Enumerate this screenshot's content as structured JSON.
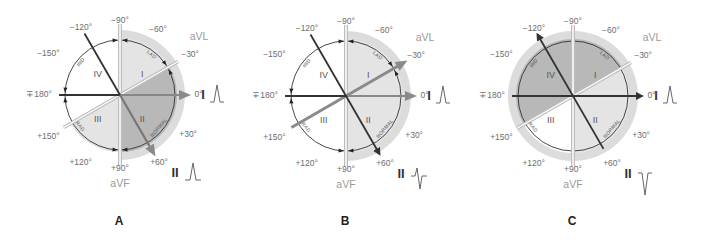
{
  "figure": {
    "panels": [
      {
        "id": "A",
        "letter": "A",
        "center": [
          120,
          95
        ],
        "radius": 57,
        "halo_sector": {
          "from": -90,
          "to": 90
        },
        "quadrant_fills": {
          "I": "#e4e4e4",
          "II": "#b8b8b8",
          "III": "#e4e4e4",
          "IV": "#ffffff"
        },
        "dark_wedge": {
          "from": -30,
          "to": 90,
          "color": "#b8b8b8"
        },
        "axis_arrow_angle": 0,
        "lead_I_wave": "upright",
        "lead_II_wave": "upright",
        "arrow_heads": {
          "lead_I": true,
          "lead_II": true,
          "minus120": false
        }
      },
      {
        "id": "B",
        "letter": "B",
        "center": [
          346,
          96
        ],
        "radius": 57,
        "halo_sector": {
          "from": -90,
          "to": 90
        },
        "quadrant_fills": {
          "I": "#e4e4e4",
          "II": "#e4e4e4",
          "III": "#ffffff",
          "IV": "#ffffff"
        },
        "dark_wedge": null,
        "axis_arrow_angle": -30,
        "lead_I_wave": "upright",
        "lead_II_wave": "biphasic",
        "arrow_heads": {
          "lead_I": true,
          "lead_II": true,
          "minus120": false
        }
      },
      {
        "id": "C",
        "letter": "C",
        "center": [
          573,
          96
        ],
        "radius": 57,
        "halo_sector": {
          "from": -180,
          "to": 180
        },
        "quadrant_fills": {
          "I": "#b8b8b8",
          "II": "#e4e4e4",
          "III": "#e4e4e4",
          "IV": "#b8b8b8"
        },
        "dark_wedge": null,
        "axis_arrow_angle": -30,
        "lead_I_wave": "upright",
        "lead_II_wave": "inverted",
        "arrow_heads": {
          "lead_I": true,
          "lead_II": false,
          "minus120": true
        }
      }
    ],
    "angle_labels": [
      {
        "text": "−90°",
        "angle": -90,
        "dist": 1.3
      },
      {
        "text": "−60°",
        "angle": -60,
        "dist": 1.33
      },
      {
        "text": "−30°",
        "angle": -30,
        "dist": 1.42
      },
      {
        "text": "0°",
        "angle": 0,
        "dist": 1.38
      },
      {
        "text": "+30°",
        "angle": 30,
        "dist": 1.38
      },
      {
        "text": "+60°",
        "angle": 60,
        "dist": 1.37
      },
      {
        "text": "+90°",
        "angle": 90,
        "dist": 1.3
      },
      {
        "text": "+120°",
        "angle": 120,
        "dist": 1.38
      },
      {
        "text": "+150°",
        "angle": 150,
        "dist": 1.45
      },
      {
        "text": "∓180°",
        "angle": 180,
        "dist": 1.42
      },
      {
        "text": "−150°",
        "angle": -150,
        "dist": 1.45
      },
      {
        "text": "−120°",
        "angle": -120,
        "dist": 1.37
      }
    ],
    "quadrant_labels": [
      {
        "text": "I",
        "angle": -45,
        "dist": 0.55
      },
      {
        "text": "II",
        "angle": 45,
        "dist": 0.55
      },
      {
        "text": "III",
        "angle": 135,
        "dist": 0.55
      },
      {
        "text": "IV",
        "angle": -135,
        "dist": 0.55
      }
    ],
    "arc_labels": [
      {
        "text": "LAD",
        "angle": -52
      },
      {
        "text": "NORMAL",
        "angle": 40
      },
      {
        "text": "RAD",
        "angle": 142
      },
      {
        "text": "IND",
        "angle": -140
      }
    ],
    "lead_names": {
      "aVL": "aVL",
      "aVF": "aVF",
      "lead_I": "I",
      "lead_II": "II"
    },
    "colors": {
      "light_fill": "#e4e4e4",
      "dark_fill": "#b8b8b8",
      "halo": "#dcdcdc",
      "axis_dark": "#333333",
      "axis_gray": "#888888",
      "double_line": "#bdbdbd",
      "circle_stroke": "#333333",
      "wave": "#555555"
    }
  }
}
